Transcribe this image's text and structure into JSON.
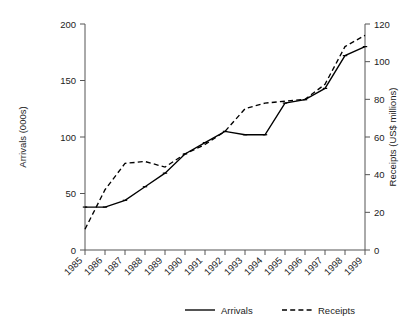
{
  "chart_data": {
    "type": "line",
    "title": "",
    "xlabel": "",
    "ylabel": "Arrivals (000s)",
    "y2label": "Receipts (US$ millions)",
    "categories": [
      "1985",
      "1986",
      "1987",
      "1988",
      "1989",
      "1990",
      "1991",
      "1992",
      "1993",
      "1994",
      "1995",
      "1996",
      "1997",
      "1998",
      "1999"
    ],
    "ylim": [
      0,
      200
    ],
    "y2lim": [
      0,
      120
    ],
    "yticks": [
      "0",
      "50",
      "100",
      "150",
      "200"
    ],
    "y2ticks": [
      "0",
      "20",
      "40",
      "60",
      "80",
      "100",
      "120"
    ],
    "grid": false,
    "legend_position": "bottom",
    "series": [
      {
        "name": "Arrivals",
        "axis": "left",
        "style": "solid",
        "color": "#000000",
        "units": "000s",
        "values": [
          38,
          38,
          44,
          56,
          68,
          85,
          95,
          105,
          102,
          102,
          130,
          133,
          143,
          172,
          180
        ]
      },
      {
        "name": "Receipts",
        "axis": "right",
        "style": "dashed",
        "color": "#000000",
        "units": "US$ millions",
        "values": [
          11,
          32,
          46,
          47,
          44,
          51,
          56,
          63,
          75,
          78,
          79,
          80,
          88,
          108,
          114
        ]
      }
    ]
  },
  "legend": {
    "items": [
      {
        "label": "Arrivals",
        "style": "solid"
      },
      {
        "label": "Receipts",
        "style": "dashed"
      }
    ]
  },
  "axes": {
    "left_title": "Arrivals (000s)",
    "right_title": "Receipts (US$ millions)"
  }
}
